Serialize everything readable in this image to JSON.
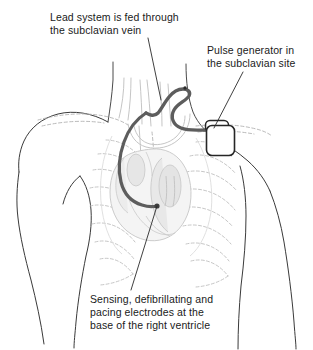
{
  "figure": {
    "width": 313,
    "height": 350,
    "background_color": "#ffffff"
  },
  "annotations": [
    {
      "id": "lead-system",
      "line1": "Lead system is fed through",
      "line2": "the subclavian vein",
      "text": "Lead system is fed through\nthe subclavian vein",
      "x": 50,
      "y": 11,
      "leader_from": [
        148,
        38
      ],
      "leader_to": [
        161,
        100
      ]
    },
    {
      "id": "pulse-generator",
      "line1": "Pulse generator in",
      "line2": "the subclavian site",
      "text": "Pulse generator in\nthe subclavian site",
      "x": 207,
      "y": 44,
      "leader_from": [
        243,
        72
      ],
      "leader_to": [
        214,
        128
      ]
    },
    {
      "id": "electrodes",
      "line1": "Sensing, defibrillating and",
      "line2": "pacing electrodes at the",
      "line3": "base of the right ventricle",
      "text": "Sensing, defibrillating and\npacing electrodes at the\nbase of the right ventricle",
      "x": 90,
      "y": 293,
      "leader_from": [
        157,
        206
      ],
      "leader_to": [
        131,
        290
      ]
    }
  ],
  "anatomy": {
    "body_outline_label": "torso-and-shoulders",
    "ribcage_label": "ribcage",
    "clavicle_label": "clavicle",
    "heart_label": "heart",
    "great_vessels_label": "great-vessels",
    "lung_label": "lung-field"
  },
  "device": {
    "pulse_generator_label": "pulse-generator",
    "lead_label": "defibrillator-lead",
    "lead_tip_label": "lead-tip-electrode",
    "connector_label": "lead-connector-header"
  },
  "colors": {
    "ink": "#1a1a1a",
    "body_outline": "#3a3a3a",
    "anatomy_light": "#b8b8b8",
    "anatomy_lighter": "#cfcfcf",
    "organ_fill": "#f2f2f2",
    "organ_fill_dark": "#e4e4e4",
    "lead": "#5d5d5d",
    "device_stroke": "#262626",
    "device_fill": "#ffffff",
    "leader_line": "#2a2a2a",
    "background": "#ffffff"
  }
}
